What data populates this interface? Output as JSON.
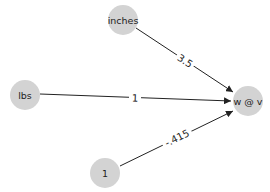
{
  "diagram": {
    "type": "directed-graph",
    "node_color": "#d3d3d3",
    "edge_color": "#222222",
    "nodes": [
      {
        "id": "inches",
        "label": "inches",
        "x": 123,
        "y": 20
      },
      {
        "id": "lbs",
        "label": "lbs",
        "x": 25,
        "y": 95
      },
      {
        "id": "one",
        "label": "1",
        "x": 105,
        "y": 173
      },
      {
        "id": "wv",
        "label": "w @ v",
        "x": 248,
        "y": 101
      }
    ],
    "edges": [
      {
        "from": "inches",
        "to": "wv",
        "label": "3.5"
      },
      {
        "from": "lbs",
        "to": "wv",
        "label": "1"
      },
      {
        "from": "one",
        "to": "wv",
        "label": "-.415"
      }
    ]
  }
}
